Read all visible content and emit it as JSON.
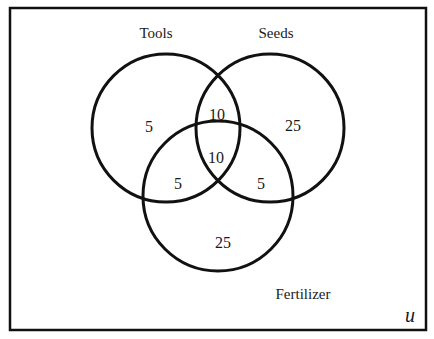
{
  "diagram": {
    "type": "venn",
    "universe_label": "u",
    "sets": [
      {
        "name": "Tools",
        "label": "Tools"
      },
      {
        "name": "Seeds",
        "label": "Seeds"
      },
      {
        "name": "Fertilizer",
        "label": "Fertilizer"
      }
    ],
    "regions": {
      "tools_only": "5",
      "seeds_only": "25",
      "fertilizer_only": "25",
      "tools_seeds_only": "10",
      "tools_fertilizer_only": "5",
      "seeds_fertilizer_only": "5",
      "all_three": "10"
    },
    "colors": {
      "stroke": "#111111",
      "background": "#ffffff"
    }
  }
}
